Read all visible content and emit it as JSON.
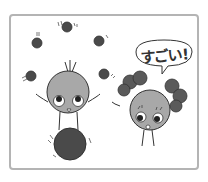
{
  "illustration": {
    "speech_bubble": {
      "text": "すごい!"
    },
    "colors": {
      "frame_border": "#b4b4b4",
      "character_body": "#a8a8a8",
      "ball": "#4a4a4a",
      "bow": "#5a5a5a",
      "outline": "#333333"
    },
    "characters": [
      {
        "name": "juggler",
        "pose": "balancing on ball, juggling"
      },
      {
        "name": "girl",
        "pose": "waving, amazed"
      }
    ],
    "juggling_balls_count": 5
  }
}
